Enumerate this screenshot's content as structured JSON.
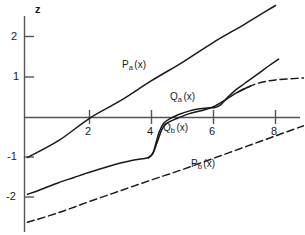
{
  "chart_data": {
    "type": "line",
    "title": "",
    "xlabel": "",
    "ylabel": "z",
    "xlim": [
      -0.1,
      9.0
    ],
    "ylim": [
      -2.9,
      2.7
    ],
    "grid": false,
    "legend_position": "inline-labels",
    "axis_color": "#555555",
    "curve_color": "#1a1a1a",
    "x_ticks": [
      {
        "value": 2,
        "label": "2"
      },
      {
        "value": 4,
        "label": "4"
      },
      {
        "value": 6,
        "label": "6"
      },
      {
        "value": 8,
        "label": "8"
      }
    ],
    "y_ticks": [
      {
        "value": 2,
        "label": "2"
      },
      {
        "value": 1,
        "label": "1"
      },
      {
        "value": -1,
        "label": "-1"
      },
      {
        "value": -2,
        "label": "-2"
      }
    ],
    "series": [
      {
        "name": "P_a(x)",
        "style": "solid",
        "label": "P",
        "label_sub": "a",
        "label_paren": "(x)",
        "points": [
          [
            0.0,
            -1.0
          ],
          [
            1.0,
            -0.58
          ],
          [
            2.0,
            -0.02
          ],
          [
            3.0,
            0.42
          ],
          [
            4.0,
            0.92
          ],
          [
            5.0,
            1.38
          ],
          [
            6.0,
            1.88
          ],
          [
            7.0,
            2.33
          ],
          [
            8.0,
            2.8
          ]
        ]
      },
      {
        "name": "P_b(x)",
        "style": "dashed",
        "label": "P",
        "label_sub": "b",
        "label_paren": "(x)",
        "points": [
          [
            0.0,
            -2.62
          ],
          [
            1.0,
            -2.38
          ],
          [
            2.0,
            -2.1
          ],
          [
            3.0,
            -1.83
          ],
          [
            4.0,
            -1.56
          ],
          [
            5.0,
            -1.3
          ],
          [
            6.0,
            -1.02
          ],
          [
            7.0,
            -0.74
          ],
          [
            8.0,
            -0.46
          ],
          [
            9.0,
            -0.18
          ]
        ]
      },
      {
        "name": "Q_a(x)",
        "style": "solid",
        "label": "Q",
        "label_sub": "a",
        "label_paren": "(x)",
        "points": [
          [
            0.0,
            -1.92
          ],
          [
            0.5,
            -1.78
          ],
          [
            1.0,
            -1.63
          ],
          [
            1.5,
            -1.5
          ],
          [
            2.0,
            -1.37
          ],
          [
            2.5,
            -1.25
          ],
          [
            3.0,
            -1.14
          ],
          [
            3.4,
            -1.07
          ],
          [
            3.7,
            -1.03
          ],
          [
            3.9,
            -1.0
          ],
          [
            4.05,
            -0.88
          ],
          [
            4.15,
            -0.62
          ],
          [
            4.25,
            -0.36
          ],
          [
            4.4,
            -0.14
          ],
          [
            4.6,
            -0.03
          ],
          [
            4.9,
            0.08
          ],
          [
            5.2,
            0.16
          ],
          [
            5.5,
            0.21
          ],
          [
            5.8,
            0.24
          ],
          [
            6.05,
            0.25
          ],
          [
            6.25,
            0.33
          ],
          [
            6.45,
            0.5
          ],
          [
            6.7,
            0.68
          ],
          [
            7.0,
            0.85
          ],
          [
            7.4,
            1.07
          ],
          [
            7.8,
            1.3
          ],
          [
            8.1,
            1.46
          ]
        ]
      },
      {
        "name": "Q_b(x)",
        "style": "solid-then-dashed",
        "label": "Q",
        "label_sub": "b",
        "label_paren": "(x)",
        "points": [
          [
            3.9,
            -1.01
          ],
          [
            4.05,
            -0.9
          ],
          [
            4.2,
            -0.58
          ],
          [
            4.35,
            -0.28
          ],
          [
            4.5,
            -0.14
          ],
          [
            4.8,
            -0.03
          ],
          [
            5.2,
            0.09
          ],
          [
            5.6,
            0.17
          ],
          [
            6.0,
            0.27
          ],
          [
            6.4,
            0.45
          ],
          [
            6.8,
            0.64
          ],
          [
            7.2,
            0.79
          ],
          [
            7.6,
            0.89
          ],
          [
            8.0,
            0.94
          ],
          [
            8.5,
            0.97
          ],
          [
            9.0,
            0.99
          ]
        ]
      }
    ],
    "annotations": [
      {
        "text": "z",
        "x_px": 38,
        "y_px": 7,
        "kind": "axis-title"
      },
      {
        "text": "P",
        "sub": "a",
        "paren": "(x)",
        "x_px": 122,
        "y_px": 60,
        "kind": "curve-label"
      },
      {
        "text": "Q",
        "sub": "a",
        "paren": "(x)",
        "x_px": 170,
        "y_px": 92,
        "kind": "curve-label"
      },
      {
        "text": "Q",
        "sub": "b",
        "paren": "(x)",
        "x_px": 163,
        "y_px": 123,
        "kind": "curve-label"
      },
      {
        "text": "P",
        "sub": "b",
        "paren": "(x)",
        "x_px": 191,
        "y_px": 159,
        "kind": "curve-label"
      }
    ]
  }
}
